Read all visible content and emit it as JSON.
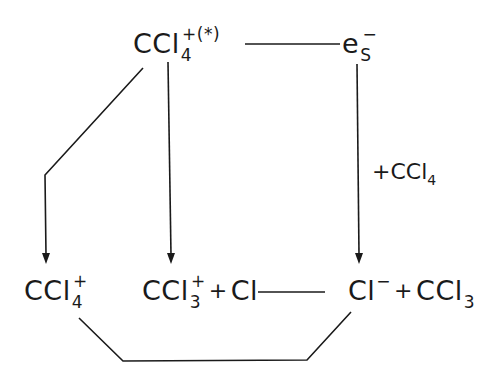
{
  "diagram": {
    "type": "reaction-scheme",
    "nodes": {
      "top_left": {
        "base": "CCl",
        "subscript": "4",
        "superscript": "+(*)"
      },
      "top_right": {
        "base": "e",
        "subscript": "S",
        "superscript": "−"
      },
      "bottom_left": {
        "base": "CCl",
        "subscript": "4",
        "superscript": "+"
      },
      "bottom_middle": {
        "base": "CCl",
        "subscript": "3",
        "superscript": "+",
        "operator": "+",
        "partner": "Cl"
      },
      "bottom_right": {
        "base": "Cl",
        "superscript": "−",
        "operator": "+",
        "partner_base": "CCl",
        "partner_subscript": "3"
      }
    },
    "edge_labels": {
      "right_arrow": {
        "prefix": "+CCl",
        "subscript": "4"
      }
    },
    "edges": [
      {
        "from": "top_left",
        "to": "top_right",
        "style": "line"
      },
      {
        "from": "top_left",
        "to": "bottom_left",
        "style": "arrow"
      },
      {
        "from": "top_left",
        "to": "bottom_middle",
        "style": "arrow"
      },
      {
        "from": "top_right",
        "to": "bottom_right",
        "style": "arrow",
        "label": "+CCl4"
      },
      {
        "from": "bottom_middle",
        "to": "bottom_right",
        "style": "line"
      },
      {
        "from": "bottom_left",
        "to": "bottom_right",
        "style": "line"
      }
    ],
    "colors": {
      "ink": "#1a1a1a",
      "background": "#ffffff"
    }
  }
}
